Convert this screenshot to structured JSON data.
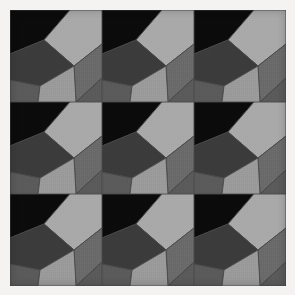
{
  "artwork": {
    "title": "Abstract geometric tiling",
    "medium": "flat-color polygon composition",
    "canvas": {
      "width": 295,
      "height": 295,
      "units": "px"
    },
    "frame": {
      "name": "paper-border",
      "color": "#f4f3f1",
      "inset_px": 10,
      "plate_width": 276,
      "plate_height": 276
    },
    "grid": {
      "rows": 3,
      "columns": 3,
      "tile_count": 9,
      "tile_width": 92,
      "tile_height": 92,
      "repeat_mode": "identical-tile",
      "seam_color": "#4a4a4a"
    },
    "palette": {
      "near_black": "#0b0b0b",
      "shadow": "#1c1c1c",
      "dark_gray": "#3b3b3b",
      "charcoal": "#454545",
      "mid_gray": "#5a5a5a",
      "warm_gray": "#6a6a6a",
      "light_gray": "#a9a9a9",
      "pale_gray": "#9a9a9a",
      "seam": "#4a4a4a"
    },
    "tile_pattern": {
      "description": "sheared 2x2 quadrilateral block rotated about 18 degrees",
      "shear_angle_deg": 18,
      "regions": [
        {
          "name": "upper-left-void",
          "fill": "#0b0b0b",
          "points": "0,0 60,0 34,30 0,44"
        },
        {
          "name": "upper-right-light",
          "fill": "#a9a9a9",
          "points": "60,0 92,0 92,34 64,56 34,30"
        },
        {
          "name": "center-dark",
          "fill": "#3b3b3b",
          "points": "0,44 34,30 64,56 30,76 0,70"
        },
        {
          "name": "right-mid",
          "fill": "#6a6a6a",
          "points": "92,34 92,68 66,92 64,56"
        },
        {
          "name": "lower-left-mid",
          "fill": "#5a5a5a",
          "points": "0,70 30,76 28,92 0,92"
        },
        {
          "name": "lower-center-pale",
          "fill": "#9a9a9a",
          "points": "30,76 64,56 66,92 28,92"
        },
        {
          "name": "lower-right-edge",
          "fill": "#5a5a5a",
          "points": "66,92 92,68 92,92"
        }
      ]
    },
    "tiles": [
      {
        "id": "tile-r1c1",
        "row": 1,
        "column": 1
      },
      {
        "id": "tile-r1c2",
        "row": 1,
        "column": 2
      },
      {
        "id": "tile-r1c3",
        "row": 1,
        "column": 3
      },
      {
        "id": "tile-r2c1",
        "row": 2,
        "column": 1
      },
      {
        "id": "tile-r2c2",
        "row": 2,
        "column": 2
      },
      {
        "id": "tile-r2c3",
        "row": 2,
        "column": 3
      },
      {
        "id": "tile-r3c1",
        "row": 3,
        "column": 1
      },
      {
        "id": "tile-r3c2",
        "row": 3,
        "column": 2
      },
      {
        "id": "tile-r3c3",
        "row": 3,
        "column": 3
      }
    ]
  }
}
